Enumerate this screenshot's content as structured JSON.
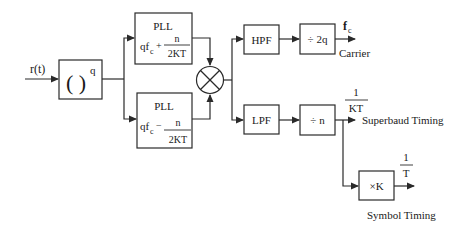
{
  "diagram": {
    "input": {
      "label": "r(t)"
    },
    "power_block": {
      "label": "( )",
      "exponent": "q"
    },
    "pll_upper": {
      "title": "PLL",
      "prefix": "qf",
      "sub": "c",
      "op": "+",
      "num": "n",
      "den": "2KT"
    },
    "pll_lower": {
      "title": "PLL",
      "prefix": "qf",
      "sub": "c",
      "op": "−",
      "num": "n",
      "den": "2KT"
    },
    "mixer": {
      "symbol": "multiplier"
    },
    "hpf": {
      "label": "HPF"
    },
    "lpf": {
      "label": "LPF"
    },
    "div_2q": {
      "label": "÷ 2q"
    },
    "div_n": {
      "label": "÷ n"
    },
    "times_k": {
      "label": "×K"
    },
    "carrier_output": {
      "symbol": "f",
      "sub": "c",
      "label": "Carrier"
    },
    "superbaud_output": {
      "num": "1",
      "den": "KT",
      "label": "Superbaud Timing"
    },
    "symbol_output": {
      "num": "1",
      "den": "T",
      "label": "Symbol Timing"
    },
    "colors": {
      "line": "#2a2a2a",
      "text": "#1a1a1a",
      "background": "#ffffff"
    }
  }
}
